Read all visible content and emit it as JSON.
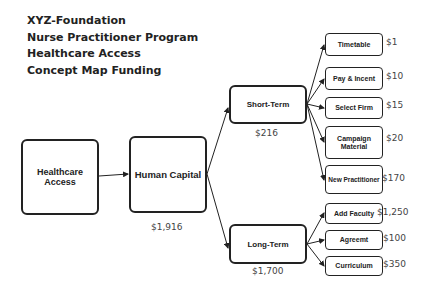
{
  "title": {
    "lines": [
      "XYZ-Foundation",
      "Nurse Practitioner Program",
      "Healthcare Access",
      "Concept Map Funding"
    ]
  },
  "nodes": {
    "healthcare_access": {
      "label": "Healthcare Access"
    },
    "human_capital": {
      "label": "Human Capital",
      "amount": "$1,916"
    },
    "short_term": {
      "label": "Short-Term",
      "amount": "$216"
    },
    "long_term": {
      "label": "Long-Term",
      "amount": "$1,700"
    },
    "short_term_items": [
      {
        "label": "Timetable",
        "amount": "$1"
      },
      {
        "label": "Pay & Incent",
        "amount": "$10"
      },
      {
        "label": "Select Firm",
        "amount": "$15"
      },
      {
        "label": "Campaign Material",
        "amount": "$20"
      },
      {
        "label": "New Practitioner",
        "amount": "$170"
      }
    ],
    "long_term_items": [
      {
        "label": "Add Faculty",
        "amount": "$1,250"
      },
      {
        "label": "Agreemt",
        "amount": "$100"
      },
      {
        "label": "Curriculum",
        "amount": "$350"
      }
    ]
  },
  "colors": {
    "stroke": "#222222",
    "amount_text": "#444444"
  }
}
